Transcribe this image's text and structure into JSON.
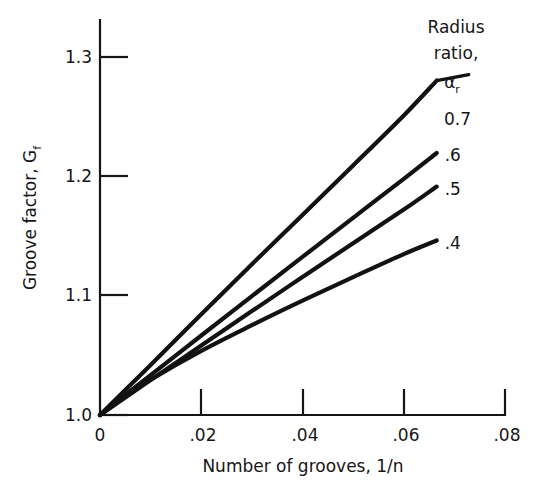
{
  "chart_data": {
    "type": "line",
    "title": "",
    "xlabel": "Number of grooves,  1/n",
    "ylabel": "Groove factor,  G",
    "ylabel_sub": "f",
    "xlim": [
      0,
      0.08
    ],
    "ylim": [
      1.0,
      1.3
    ],
    "xticks": [
      0,
      0.02,
      0.04,
      0.06,
      0.08
    ],
    "xticklabels": [
      "0",
      ".02",
      ".04",
      ".06",
      ".08"
    ],
    "yticks": [
      1.0,
      1.1,
      1.2,
      1.3
    ],
    "yticklabels": [
      "1.0",
      "1.1",
      "1.2",
      "1.3"
    ],
    "grid": false,
    "legend_position": "upper-right",
    "legend": {
      "title_line1": "Radius",
      "title_line2": "ratio,",
      "symbol": "α",
      "symbol_sub": "r"
    },
    "series": [
      {
        "name": "0.7",
        "label": ".7",
        "display_label": "0.7",
        "x": [
          0,
          0.005,
          0.01,
          0.02,
          0.03,
          0.04,
          0.05,
          0.06,
          0.0665
        ],
        "values": [
          1.0,
          1.019,
          1.038,
          1.0765,
          1.1145,
          1.152,
          1.1895,
          1.2275,
          1.254
        ]
      },
      {
        "name": "0.6",
        "label": ".6",
        "display_label": ".6",
        "x": [
          0,
          0.005,
          0.01,
          0.02,
          0.03,
          0.04,
          0.05,
          0.06,
          0.0665
        ],
        "values": [
          1.0,
          1.0152,
          1.0303,
          1.0604,
          1.0903,
          1.1201,
          1.1498,
          1.1793,
          1.199
        ]
      },
      {
        "name": "0.5",
        "label": ".5",
        "display_label": ".5",
        "x": [
          0,
          0.005,
          0.01,
          0.02,
          0.03,
          0.04,
          0.05,
          0.06,
          0.0665
        ],
        "values": [
          1.0,
          1.0133,
          1.0265,
          1.0528,
          1.0789,
          1.1048,
          1.1305,
          1.156,
          1.1735
        ]
      },
      {
        "name": "0.4",
        "label": ".4",
        "display_label": ".4",
        "x": [
          0,
          0.005,
          0.01,
          0.02,
          0.03,
          0.04,
          0.05,
          0.06,
          0.0665
        ],
        "values": [
          1.0,
          1.0142,
          1.0268,
          1.0487,
          1.0682,
          1.0868,
          1.1047,
          1.1222,
          1.1325
        ]
      }
    ]
  }
}
